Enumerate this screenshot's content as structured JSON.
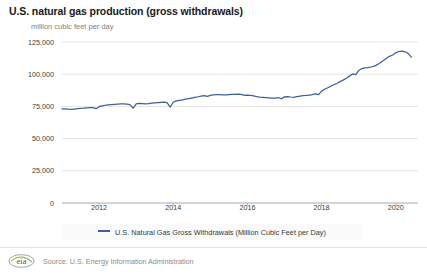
{
  "chart_data": {
    "type": "line",
    "title": "U.S. natural gas production (gross withdrawals)",
    "subtitle": "million cubic feet per day",
    "xlabel": "",
    "ylabel": "million cubic feet per day",
    "ylim": [
      0,
      125000
    ],
    "xlim": [
      2011.0,
      2020.6
    ],
    "grid": true,
    "legend_position": "bottom",
    "yticks": [
      "0",
      "25,000",
      "50,000",
      "75,000",
      "100,000",
      "125,000"
    ],
    "ytick_values": [
      0,
      25000,
      50000,
      75000,
      100000,
      125000
    ],
    "xticks": [
      "2012",
      "2014",
      "2016",
      "2018",
      "2020"
    ],
    "xtick_values": [
      2012,
      2014,
      2016,
      2018,
      2020
    ],
    "series": [
      {
        "name": "U.S. Natural Gas Gross Withdrawals (Million Cubic Feet per Day)",
        "color": "#3c5f96",
        "x": [
          2011.0,
          2011.08,
          2011.17,
          2011.25,
          2011.33,
          2011.42,
          2011.5,
          2011.58,
          2011.67,
          2011.75,
          2011.83,
          2011.92,
          2012.0,
          2012.08,
          2012.17,
          2012.25,
          2012.33,
          2012.42,
          2012.5,
          2012.58,
          2012.67,
          2012.75,
          2012.83,
          2012.92,
          2013.0,
          2013.08,
          2013.17,
          2013.25,
          2013.33,
          2013.42,
          2013.5,
          2013.58,
          2013.67,
          2013.75,
          2013.83,
          2013.92,
          2014.0,
          2014.08,
          2014.17,
          2014.25,
          2014.33,
          2014.42,
          2014.5,
          2014.58,
          2014.67,
          2014.75,
          2014.83,
          2014.92,
          2015.0,
          2015.08,
          2015.17,
          2015.25,
          2015.33,
          2015.42,
          2015.5,
          2015.58,
          2015.67,
          2015.75,
          2015.83,
          2015.92,
          2016.0,
          2016.08,
          2016.17,
          2016.25,
          2016.33,
          2016.42,
          2016.5,
          2016.58,
          2016.67,
          2016.75,
          2016.83,
          2016.92,
          2017.0,
          2017.08,
          2017.17,
          2017.25,
          2017.33,
          2017.42,
          2017.5,
          2017.58,
          2017.67,
          2017.75,
          2017.83,
          2017.92,
          2018.0,
          2018.08,
          2018.17,
          2018.25,
          2018.33,
          2018.42,
          2018.5,
          2018.58,
          2018.67,
          2018.75,
          2018.83,
          2018.92,
          2019.0,
          2019.08,
          2019.17,
          2019.25,
          2019.33,
          2019.42,
          2019.5,
          2019.58,
          2019.67,
          2019.75,
          2019.83,
          2019.92,
          2020.0,
          2020.08,
          2020.17,
          2020.25,
          2020.33,
          2020.42
        ],
        "values": [
          73000,
          73100,
          72800,
          72600,
          72900,
          73200,
          73400,
          73600,
          73900,
          74100,
          74000,
          73200,
          74800,
          75400,
          75900,
          76100,
          76300,
          76500,
          76700,
          76900,
          77000,
          76800,
          76400,
          73600,
          76900,
          77400,
          77200,
          76900,
          77100,
          77500,
          77800,
          78000,
          78200,
          78300,
          78000,
          74500,
          78200,
          79300,
          79700,
          80100,
          80600,
          81000,
          81500,
          82000,
          82500,
          83000,
          83300,
          82800,
          83600,
          84000,
          84200,
          84100,
          83900,
          84000,
          84200,
          84300,
          84400,
          84500,
          84300,
          83600,
          83800,
          83600,
          83100,
          82600,
          82200,
          82000,
          81800,
          81600,
          81400,
          81500,
          81900,
          80900,
          82400,
          82600,
          82300,
          82100,
          82500,
          83000,
          83300,
          83500,
          83800,
          84200,
          84800,
          84100,
          86800,
          88300,
          89500,
          90600,
          91800,
          93000,
          94200,
          95400,
          96900,
          98500,
          100200,
          99600,
          102800,
          104300,
          104900,
          105100,
          105600,
          106200,
          107400,
          108900,
          110600,
          112300,
          113900,
          114900,
          116600,
          117600,
          117900,
          117400,
          116200,
          113300
        ]
      }
    ]
  },
  "legend": {
    "label": "U.S. Natural Gas Gross Withdrawals (Million Cubic Feet per Day)",
    "color": "#3c5f96"
  },
  "footer": {
    "logo_text": "eia",
    "source": "Source: U.S. Energy Information Administration"
  }
}
